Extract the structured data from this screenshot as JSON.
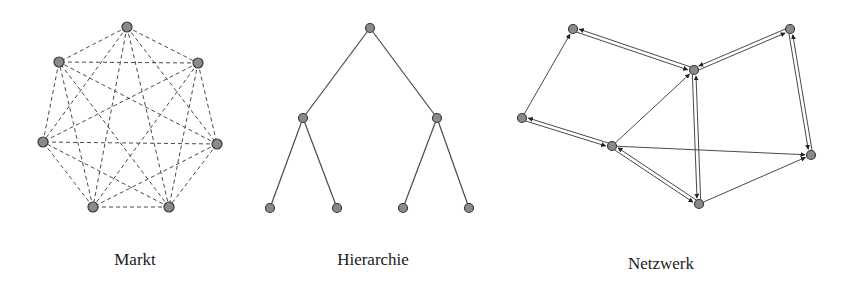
{
  "colors": {
    "node_fill": "#8a8a8a",
    "node_stroke": "#3a3a3a",
    "edge": "#4a4a4a",
    "text": "#1a1a1a"
  },
  "diagrams": [
    {
      "id": "markt",
      "label": "Markt",
      "label_pos": [
        135,
        266
      ],
      "edge_style": "dashed",
      "nodes": [
        [
          127,
          27
        ],
        [
          198,
          63
        ],
        [
          217,
          144
        ],
        [
          169,
          207
        ],
        [
          93,
          207
        ],
        [
          43,
          142
        ],
        [
          59,
          62
        ]
      ],
      "edges": "complete"
    },
    {
      "id": "hierarchie",
      "label": "Hierarchie",
      "label_pos": [
        373,
        266
      ],
      "edge_style": "solid",
      "nodes": [
        [
          370,
          28
        ],
        [
          303,
          118
        ],
        [
          437,
          118
        ],
        [
          270,
          208
        ],
        [
          337,
          208
        ],
        [
          403,
          208
        ],
        [
          469,
          208
        ]
      ],
      "edges": [
        [
          0,
          1
        ],
        [
          0,
          2
        ],
        [
          1,
          3
        ],
        [
          1,
          4
        ],
        [
          2,
          5
        ],
        [
          2,
          6
        ]
      ]
    },
    {
      "id": "netzwerk",
      "label": "Netzwerk",
      "label_pos": [
        661,
        270
      ],
      "nodes": [
        [
          573,
          29
        ],
        [
          694,
          70
        ],
        [
          790,
          29
        ],
        [
          522,
          118
        ],
        [
          612,
          146
        ],
        [
          811,
          155
        ],
        [
          699,
          204
        ]
      ],
      "double_edges": [
        [
          0,
          1
        ],
        [
          1,
          2
        ],
        [
          2,
          5
        ],
        [
          3,
          4
        ],
        [
          4,
          6
        ],
        [
          1,
          6
        ]
      ],
      "single_edges": [
        [
          3,
          0
        ],
        [
          4,
          1
        ],
        [
          4,
          5
        ],
        [
          6,
          5
        ]
      ]
    }
  ]
}
